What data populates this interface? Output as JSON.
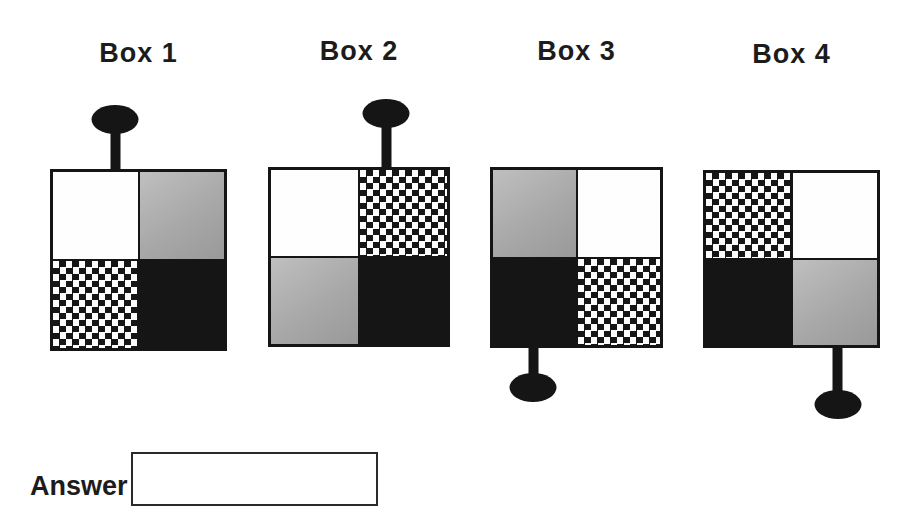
{
  "colors": {
    "ink": "#151515",
    "background": "#ffffff",
    "gray_fill_light": "#bfbfbf",
    "gray_fill_dark": "#999999"
  },
  "boxes": [
    {
      "label": "Box 1",
      "pin": {
        "side": "top",
        "offset_pct": 37,
        "stem_len": 38
      },
      "quadrants": {
        "top_left": "white",
        "top_right": "gray",
        "bottom_left": "checker",
        "bottom_right": "black"
      }
    },
    {
      "label": "Box 2",
      "pin": {
        "side": "top",
        "offset_pct": 65,
        "stem_len": 42
      },
      "quadrants": {
        "top_left": "white",
        "top_right": "checker",
        "bottom_left": "gray",
        "bottom_right": "black"
      }
    },
    {
      "label": "Box 3",
      "pin": {
        "side": "bottom",
        "offset_pct": 25,
        "stem_len": 28
      },
      "quadrants": {
        "top_left": "gray",
        "top_right": "white",
        "bottom_left": "black",
        "bottom_right": "checker"
      }
    },
    {
      "label": "Box 4",
      "pin": {
        "side": "bottom",
        "offset_pct": 76,
        "stem_len": 45
      },
      "quadrants": {
        "top_left": "checker",
        "top_right": "white",
        "bottom_left": "black",
        "bottom_right": "gray"
      }
    }
  ],
  "answer": {
    "label": "Answer",
    "value": ""
  }
}
